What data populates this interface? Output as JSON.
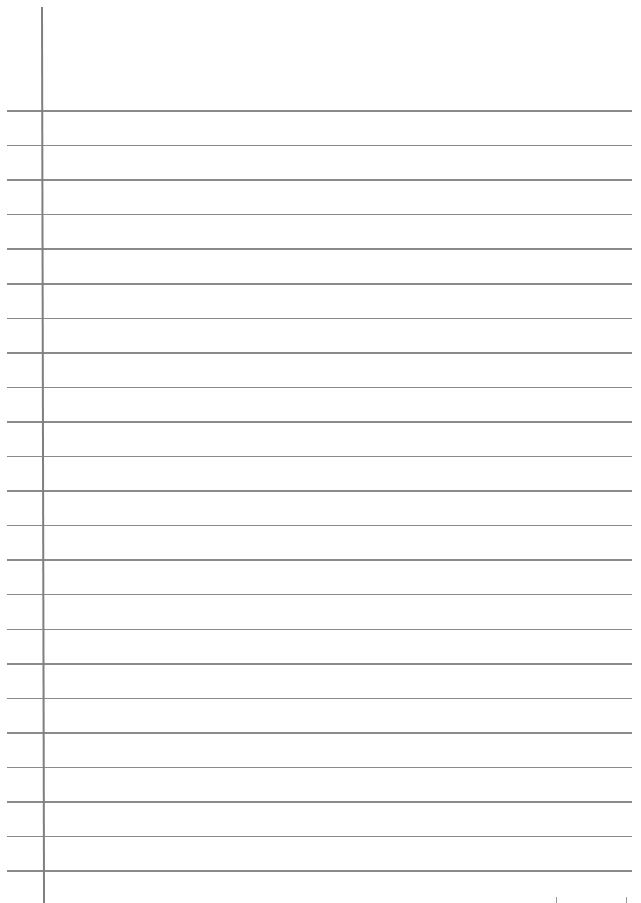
{
  "page": {
    "type": "ruled-notebook-paper",
    "background_color": "#ffffff",
    "line_color": "#8a8a8a",
    "margin_color": "#7f7f7f",
    "rules": {
      "count": 23,
      "first_y": 111,
      "spacing": 34.55,
      "left_x": 7,
      "right_x": 632
    },
    "margin_line": {
      "x": 41,
      "top_y": 7
    },
    "bottom_ticks": [
      556,
      626
    ]
  }
}
